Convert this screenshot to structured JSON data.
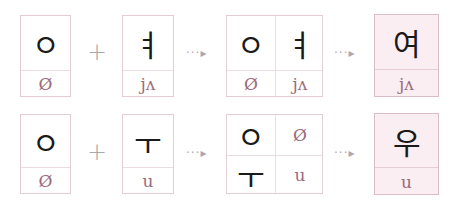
{
  "rows": [
    {
      "consonant": {
        "char": "ㅇ",
        "ipa": "Ø"
      },
      "plus": "+",
      "vowel": {
        "char": "ㅕ",
        "ipa": "jʌ"
      },
      "arrow1": "···▸",
      "combo": {
        "top_left": "ㅇ",
        "top_right": "ㅕ",
        "bottom_left": "Ø",
        "bottom_right": "jʌ"
      },
      "arrow2": "···▸",
      "result": {
        "char": "여",
        "ipa": "jʌ"
      }
    },
    {
      "consonant": {
        "char": "ㅇ",
        "ipa": "Ø"
      },
      "plus": "+",
      "vowel": {
        "char": "ㅜ",
        "ipa": "u"
      },
      "arrow1": "···▸",
      "combo": {
        "top_left": "ㅇ",
        "top_right": "Ø",
        "bottom_left": "ㅜ",
        "bottom_right": "u"
      },
      "arrow2": "···▸",
      "result": {
        "char": "우",
        "ipa": "u"
      }
    }
  ],
  "colors": {
    "ipa": "#9a6b7c",
    "border": "#e3ccd2",
    "result_bg": "#fbeef2"
  }
}
